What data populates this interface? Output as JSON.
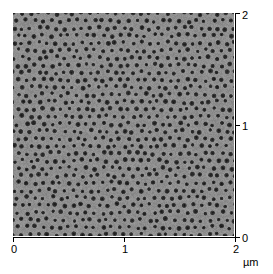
{
  "figure": {
    "kind": "afm-micrograph",
    "background_color": "#ffffff",
    "axis_color": "#000000"
  },
  "axes": {
    "unit_label": "µm",
    "bottom": {
      "ticks": [
        "0",
        "1",
        "2"
      ],
      "min": 0,
      "max": 2
    },
    "right": {
      "ticks": [
        "0",
        "1",
        "2"
      ],
      "min": 0,
      "max": 2
    }
  },
  "chart_data": {
    "type": "heatmap",
    "title": "",
    "subtitle": "",
    "xlabel": "µm",
    "ylabel": "µm",
    "xlim": [
      0,
      2
    ],
    "ylim": [
      0,
      2
    ],
    "xticks": [
      0,
      1,
      2
    ],
    "yticks": [
      0,
      1,
      2
    ],
    "xticklabels": [
      "0",
      "1",
      "2"
    ],
    "yticklabels": [
      "0",
      "1",
      "2"
    ],
    "xaxis_position": "bottom",
    "yaxis_position": "right",
    "grid": false,
    "legend": null,
    "colorbar": false,
    "colormap": "grayscale",
    "image_description": "Hexagonally ordered nanoporous surface (anodized alumina type) imaged over a 2 by 2 micrometre scan area; dark circular pores on a mid-grey matrix with bright pore rims.",
    "surface": {
      "background_level": "#8a8a8a",
      "pore_level": "#1e1e1e",
      "rim_level": "#b8b8b8",
      "pore_pitch_um": 0.077,
      "pore_diameter_um": 0.042,
      "pore_rows": 29,
      "pore_columns": 26,
      "lattice": "hexagonal",
      "domain_disorder": 0.18,
      "noise_level": 0.07
    }
  }
}
